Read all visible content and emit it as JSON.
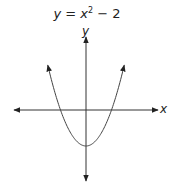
{
  "chart_data": {
    "type": "line",
    "title_parts": {
      "y": "y",
      "eq": " = ",
      "x": "x",
      "exp": "2",
      "rest": " − 2"
    },
    "xlabel": "x",
    "ylabel": "y",
    "grid": false,
    "legend": null,
    "function": "y = x^2 - 2",
    "vertex": [
      0,
      -2
    ],
    "x_intercepts": [
      -1.414,
      1.414
    ],
    "series": [
      {
        "name": "y = x^2 - 2",
        "x": [
          -2.5,
          -2,
          -1.5,
          -1.414,
          -1,
          -0.5,
          0,
          0.5,
          1,
          1.414,
          1.5,
          2,
          2.5
        ],
        "y": [
          4.25,
          2,
          0.25,
          0,
          -1,
          -1.75,
          -2,
          -1.75,
          -1,
          0,
          0.25,
          2,
          4.25
        ]
      }
    ],
    "ticks": {
      "x": [],
      "y": []
    }
  }
}
